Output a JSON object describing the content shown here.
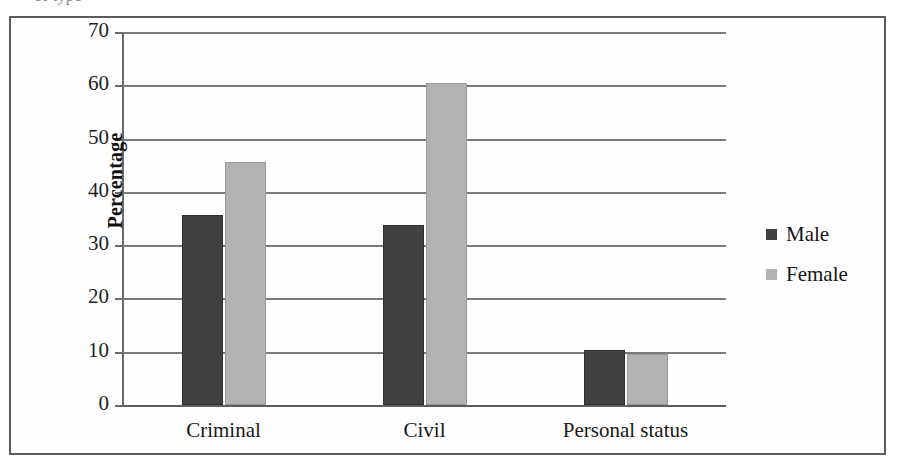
{
  "figure": {
    "caption_sliver": "of type"
  },
  "legend": {
    "position": "right",
    "entries": [
      {
        "label": "Male",
        "color": "#414141"
      },
      {
        "label": "Female",
        "color": "#b2b2b2"
      }
    ]
  },
  "axes": {
    "y_title": "Percentage",
    "y_ticks": [
      "0",
      "10",
      "20",
      "30",
      "40",
      "50",
      "60",
      "70"
    ],
    "x_categories": [
      "Criminal",
      "Civil",
      "Personal status"
    ]
  },
  "chart_data": {
    "type": "bar",
    "title": "",
    "subtitle": "",
    "xlabel": "",
    "ylabel": "Percentage",
    "categories": [
      "Criminal",
      "Civil",
      "Personal status"
    ],
    "series": [
      {
        "name": "Male",
        "color": "#414141",
        "values": [
          35.7,
          33.7,
          10.3
        ]
      },
      {
        "name": "Female",
        "color": "#b2b2b2",
        "values": [
          45.6,
          60.5,
          9.5
        ]
      }
    ],
    "ylim": [
      0,
      70
    ],
    "ytick_step": 10,
    "grid": true,
    "grid_axis": "y",
    "legend_position": "right",
    "annotations": []
  }
}
